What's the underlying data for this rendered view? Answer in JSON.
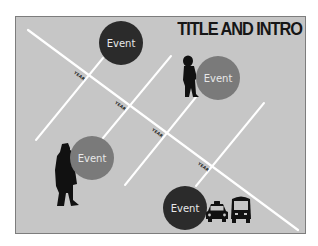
{
  "title": "TITLE AND INTRO",
  "timeline": {
    "year_labels": [
      "YEAR",
      "YEAR",
      "YEAR",
      "YEAR"
    ],
    "events": [
      {
        "label": "Event",
        "style": "dark",
        "companion": "none"
      },
      {
        "label": "Event",
        "style": "medium",
        "companion": "child-silhouette"
      },
      {
        "label": "Event",
        "style": "medium",
        "companion": "man-in-coat-silhouette"
      },
      {
        "label": "Event",
        "style": "dark",
        "companion": "taxi-and-bus-icons"
      }
    ]
  },
  "colors": {
    "background": "#c6c6c6",
    "lines": "#ffffff",
    "event_dark": "#2b2b2b",
    "event_medium": "#7a7a7a",
    "silhouette": "#111111"
  }
}
